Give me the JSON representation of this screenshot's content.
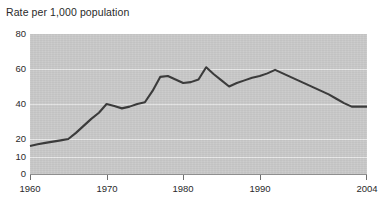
{
  "chart_data": {
    "type": "line",
    "title": "Rate per 1,000 population",
    "xlabel": "",
    "ylabel": "",
    "xlim": [
      1960,
      2004
    ],
    "ylim": [
      0,
      80
    ],
    "grid": true,
    "legend": false,
    "legend_position": "none",
    "y_ticks": [
      {
        "value": 80,
        "label": "80"
      },
      {
        "value": 60,
        "label": "60"
      },
      {
        "value": 40,
        "label": "40"
      },
      {
        "value": 20,
        "label": "20"
      },
      {
        "value": 10,
        "label": "10"
      },
      {
        "value": 0,
        "label": "0"
      }
    ],
    "x_ticks": [
      {
        "value": 1960,
        "label": "1960"
      },
      {
        "value": 1970,
        "label": "1970"
      },
      {
        "value": 1980,
        "label": "1980"
      },
      {
        "value": 1990,
        "label": "1990"
      },
      {
        "value": 2004,
        "label": "2004"
      }
    ],
    "series": [
      {
        "name": "Rate",
        "color": "#3b3b3b",
        "x": [
          1960,
          1961,
          1962,
          1963,
          1964,
          1965,
          1966,
          1967,
          1968,
          1969,
          1970,
          1971,
          1972,
          1973,
          1974,
          1975,
          1976,
          1977,
          1978,
          1979,
          1980,
          1981,
          1982,
          1983,
          1984,
          1985,
          1986,
          1987,
          1988,
          1989,
          1990,
          1991,
          1992,
          1993,
          1994,
          1995,
          1996,
          1997,
          1998,
          1999,
          2000,
          2001,
          2002,
          2003,
          2004
        ],
        "values": [
          16.0,
          17.0,
          17.8,
          18.5,
          19.2,
          20.0,
          23.5,
          27.5,
          31.5,
          35.0,
          40.0,
          38.8,
          37.5,
          38.5,
          40.0,
          41.0,
          47.5,
          55.5,
          56.0,
          54.0,
          52.0,
          52.5,
          54.0,
          61.0,
          57.0,
          53.5,
          50.0,
          52.0,
          53.5,
          55.0,
          56.0,
          57.5,
          59.5,
          57.5,
          55.5,
          53.5,
          51.5,
          49.5,
          47.5,
          45.5,
          43.0,
          40.5,
          38.5,
          38.5,
          38.5
        ]
      }
    ]
  },
  "style": {
    "plot_background": "#c9c9c9",
    "page_background": "#ffffff",
    "gridline_color": "#e8e8e8",
    "line_color": "#3b3b3b",
    "text_color": "#2a2a2a"
  }
}
